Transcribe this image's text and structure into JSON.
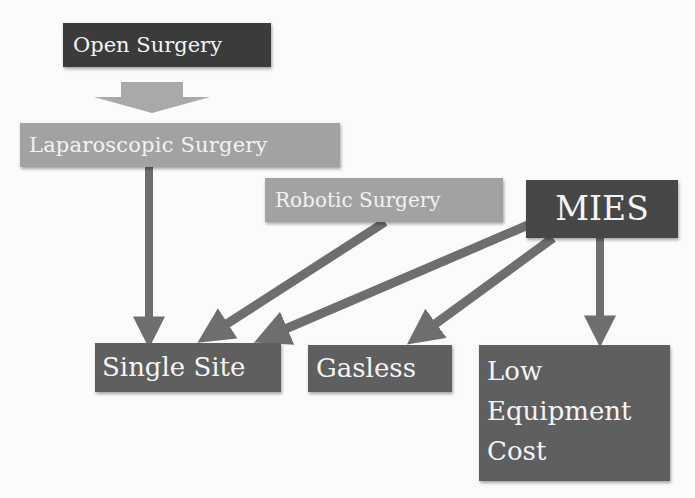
{
  "diagram": {
    "nodes": {
      "open_surgery": {
        "label": "Open Surgery"
      },
      "laparoscopic": {
        "label": "Laparoscopic Surgery"
      },
      "robotic": {
        "label": "Robotic Surgery"
      },
      "mies": {
        "label": "MIES"
      },
      "single_site": {
        "label": "Single Site"
      },
      "gasless": {
        "label": "Gasless"
      },
      "low_cost": {
        "line1": "Low",
        "line2": "Equipment",
        "line3": "Cost"
      }
    },
    "edges": [
      {
        "from": "Open Surgery",
        "to": "Laparoscopic Surgery"
      },
      {
        "from": "Laparoscopic Surgery",
        "to": "Single Site"
      },
      {
        "from": "Robotic Surgery",
        "to": "Single Site"
      },
      {
        "from": "MIES",
        "to": "Single Site"
      },
      {
        "from": "MIES",
        "to": "Gasless"
      },
      {
        "from": "MIES",
        "to": "Low Equipment Cost"
      }
    ],
    "colors": {
      "dark_box": "#3b3b3b",
      "light_box": "#a2a2a2",
      "mid_box": "#5f5f5f",
      "arrow": "#707070"
    }
  }
}
